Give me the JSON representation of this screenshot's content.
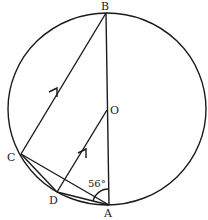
{
  "diagram": {
    "type": "circle-geometry",
    "points": {
      "B": {
        "label": "B"
      },
      "O": {
        "label": "O"
      },
      "C": {
        "label": "C"
      },
      "D": {
        "label": "D"
      },
      "A": {
        "label": "A"
      }
    },
    "angle_label": "56°",
    "segments": [
      "BA",
      "BC",
      "OD",
      "CA",
      "CD",
      "DA"
    ],
    "parallel_marks": [
      "CB",
      "DO"
    ]
  }
}
